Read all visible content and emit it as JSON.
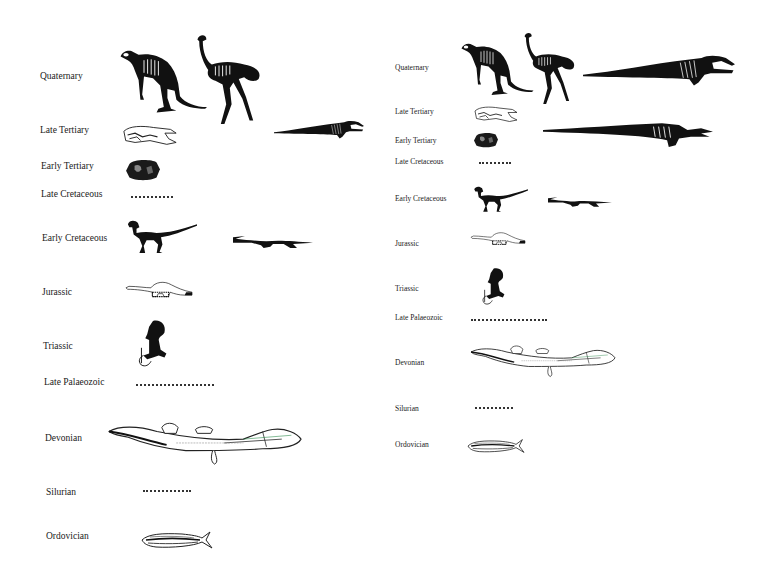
{
  "figure": {
    "panels": [
      {
        "id": "left",
        "periods": [
          {
            "label": "Quaternary",
            "fossils": [
              "kangaroo-like skeleton",
              "ostrich-like bird skeleton",
              "whale skeleton"
            ]
          },
          {
            "label": "Late Tertiary",
            "fossils": [
              "skull fragment"
            ]
          },
          {
            "label": "Early Tertiary",
            "fossils": [
              "skull fragment"
            ]
          },
          {
            "label": "Late Cretaceous",
            "fossils": [],
            "gap": true
          },
          {
            "label": "Early Cretaceous",
            "fossils": [
              "theropod dinosaur skeleton",
              "plesiosaur-like marine reptile"
            ]
          },
          {
            "label": "Jurassic",
            "fossils": [
              "sauropod dinosaur"
            ]
          },
          {
            "label": "Triassic",
            "fossils": [
              "small tailed reptile"
            ]
          },
          {
            "label": "Late Palaeozoic",
            "fossils": [],
            "gap": true
          },
          {
            "label": "Devonian",
            "fossils": [
              "lobe-finned fish"
            ]
          },
          {
            "label": "Silurian",
            "fossils": [],
            "gap": true
          },
          {
            "label": "Ordovician",
            "fossils": [
              "jawless fish"
            ]
          }
        ]
      },
      {
        "id": "right",
        "periods": [
          {
            "label": "Quaternary",
            "fossils": [
              "kangaroo-like skeleton",
              "ostrich-like bird skeleton",
              "whale skeleton"
            ]
          },
          {
            "label": "Late Tertiary",
            "fossils": [
              "skull fragment",
              "early whale skeleton"
            ]
          },
          {
            "label": "Early Tertiary",
            "fossils": [
              "skull fragment"
            ]
          },
          {
            "label": "Late Cretaceous",
            "fossils": [],
            "gap": true
          },
          {
            "label": "Early Cretaceous",
            "fossils": [
              "theropod dinosaur skeleton",
              "plesiosaur-like marine reptile"
            ]
          },
          {
            "label": "Jurassic",
            "fossils": [
              "sauropod dinosaur"
            ]
          },
          {
            "label": "Triassic",
            "fossils": [
              "small tailed reptile"
            ]
          },
          {
            "label": "Late Palaeozoic",
            "fossils": [],
            "gap": true
          },
          {
            "label": "Devonian",
            "fossils": [
              "lobe-finned fish"
            ]
          },
          {
            "label": "Silurian",
            "fossils": [],
            "gap": true
          },
          {
            "label": "Ordovician",
            "fossils": [
              "jawless fish"
            ]
          }
        ]
      }
    ]
  },
  "left": {
    "labels": [
      "Quaternary",
      "Late Tertiary",
      "Early Tertiary",
      "Late Cretaceous",
      "Early Cretaceous",
      "Jurassic",
      "Triassic",
      "Late Palaeozoic",
      "Devonian",
      "Silurian",
      "Ordovician"
    ]
  },
  "right": {
    "labels": [
      "Quaternary",
      "Late Tertiary",
      "Early Tertiary",
      "Late Cretaceous",
      "Early Cretaceous",
      "Jurassic",
      "Triassic",
      "Late Palaeozoic",
      "Devonian",
      "Silurian",
      "Ordovician"
    ]
  },
  "colors": {
    "background": "#ffffff",
    "ink": "#111111",
    "label": "#1a1a1a"
  }
}
